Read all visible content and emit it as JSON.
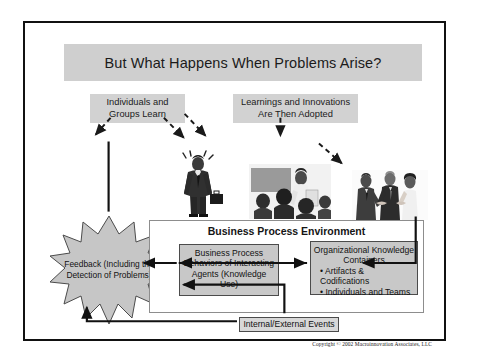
{
  "slide": {
    "title": "But What Happens When Problems Arise?",
    "copyright": "Copyright © 2002 Macroinnovation Associates, LLC"
  },
  "captions": {
    "left": "Individuals and Groups Learn",
    "right": "Learnings and Innovations Are Then Adopted"
  },
  "feedback": {
    "label": "Feedback (Including the Detection of Problems)"
  },
  "bpe": {
    "title": "Business Process Environment",
    "process_box": "Business Process Behaviors of Interacting Agents (Knowledge Use)",
    "knowledge_box": {
      "heading": "Organizational Knowledge Containers",
      "bullets": [
        "• Artifacts & Codifications",
        "• Individuals and Teams"
      ]
    },
    "events": "Internal/External Events"
  },
  "photos": {
    "businessman": "businessman-with-briefcase-photo",
    "classroom": "classroom-training-photo",
    "handshake": "business-handshake-photo"
  },
  "colors": {
    "title_bar": "#cfcfcf",
    "caption_box": "#d2d2d2",
    "inner_box": "#c8c8c8",
    "burst_fill": "#c6c6c6",
    "border": "#4b4b4b"
  }
}
